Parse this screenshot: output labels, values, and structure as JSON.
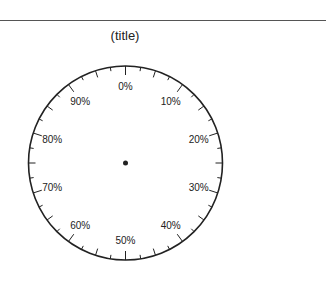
{
  "chart_data": {
    "type": "pie",
    "title": "(title)",
    "categories": [],
    "values": [],
    "center": [
      125.5,
      163
    ],
    "radius": 97,
    "scale_labels": [
      "0%",
      "10%",
      "20%",
      "30%",
      "40%",
      "50%",
      "60%",
      "70%",
      "80%",
      "90%"
    ],
    "ticks": {
      "major_every_pct": 10,
      "medium_every_pct": 5,
      "minor_every_pct": 2.5
    },
    "center_dot": true,
    "colors": {
      "line": "#222222",
      "text": "#222222",
      "background": "#ffffff"
    }
  }
}
